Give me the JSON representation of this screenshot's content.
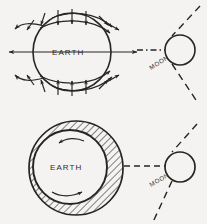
{
  "figure": {
    "background_color": "#f4f3f1",
    "ink_color": "#262524",
    "panels": [
      {
        "id": "top-panel",
        "name": "tidal-force-vectors",
        "earth_label": "EARTH",
        "moon_label": "MOON",
        "description": "Earth drawn as a circle with force arrows around its rim; dash-dot line to the Moon which sits on a dashed orbital arc.",
        "earth": {
          "cx": 72,
          "cy": 52,
          "r": 39
        },
        "moon": {
          "cx": 180,
          "cy": 50,
          "r": 15
        },
        "connector_style": "dash-dot",
        "arrow_count": 18
      },
      {
        "id": "bottom-panel",
        "name": "tidal-bulge-lag",
        "earth_label": "EARTH",
        "moon_label": "MOON",
        "description": "Earth as inner circle inside a larger hatched tidal envelope offset toward the Moon; curved rotation arrows inside.",
        "earth": {
          "cx": 70,
          "cy": 167,
          "r": 37
        },
        "envelope": {
          "cx": 76,
          "cy": 168,
          "r": 47
        },
        "moon": {
          "cx": 180,
          "cy": 167,
          "r": 15
        },
        "connector_style": "dashed",
        "hatch_fill": "diagonal-45"
      }
    ],
    "labels": {
      "earth": "EARTH",
      "moon": "MOON"
    }
  }
}
